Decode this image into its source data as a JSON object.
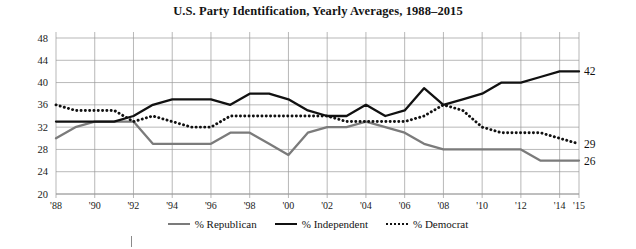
{
  "chart_data": {
    "type": "line",
    "title": "U.S. Party Identification, Yearly Averages, 1988–2015",
    "xlabel": "",
    "ylabel": "",
    "ylim": [
      20,
      48
    ],
    "ytick_values": [
      20,
      24,
      28,
      32,
      36,
      40,
      44,
      48
    ],
    "ytick_labels": [
      "20",
      "24",
      "28",
      "32",
      "36",
      "40",
      "44",
      "48"
    ],
    "grid": true,
    "legend_position": "bottom",
    "x": [
      1988,
      1989,
      1990,
      1991,
      1992,
      1993,
      1994,
      1995,
      1996,
      1997,
      1998,
      1999,
      2000,
      2001,
      2002,
      2003,
      2004,
      2005,
      2006,
      2007,
      2008,
      2009,
      2010,
      2011,
      2012,
      2013,
      2014,
      2015
    ],
    "xtick_values": [
      1988,
      1990,
      1992,
      1994,
      1996,
      1998,
      2000,
      2002,
      2004,
      2006,
      2008,
      2010,
      2012,
      2014,
      2015
    ],
    "xtick_labels": [
      "'88",
      "'90",
      "'92",
      "'94",
      "'96",
      "'98",
      "'00",
      "'02",
      "'04",
      "'06",
      "'08",
      "'10",
      "'12",
      "'14",
      "'15"
    ],
    "series": [
      {
        "name": "% Republican",
        "color": "#7b7b7b",
        "style": "solid",
        "end_label": "26",
        "values": [
          30,
          32,
          33,
          33,
          33,
          29,
          29,
          29,
          29,
          31,
          31,
          29,
          27,
          31,
          32,
          32,
          33,
          32,
          31,
          29,
          28,
          28,
          28,
          28,
          28,
          26,
          26,
          26
        ]
      },
      {
        "name": "% Independent",
        "color": "#111111",
        "style": "solid",
        "end_label": "42",
        "values": [
          33,
          33,
          33,
          33,
          34,
          36,
          37,
          37,
          37,
          36,
          38,
          38,
          37,
          35,
          34,
          34,
          36,
          34,
          35,
          39,
          36,
          37,
          38,
          40,
          40,
          41,
          42,
          42
        ]
      },
      {
        "name": "% Democrat",
        "color": "#111111",
        "style": "dotted",
        "end_label": "29",
        "values": [
          36,
          35,
          35,
          35,
          33,
          34,
          33,
          32,
          32,
          34,
          34,
          34,
          34,
          34,
          34,
          33,
          33,
          33,
          33,
          34,
          36,
          35,
          32,
          31,
          31,
          31,
          30,
          29
        ]
      }
    ]
  },
  "axes": {
    "y_axis_name": "percentage-axis",
    "x_axis_name": "year-axis"
  }
}
